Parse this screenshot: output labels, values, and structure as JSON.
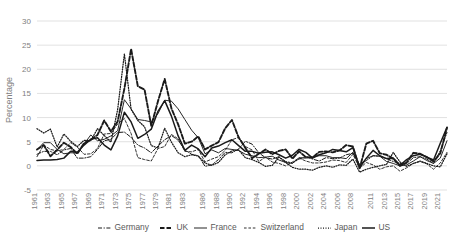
{
  "chart_data": {
    "type": "line",
    "title": "",
    "xlabel": "",
    "ylabel": "Percentage",
    "ylim": [
      -5,
      30
    ],
    "ytick_values": [
      -5,
      0,
      5,
      10,
      15,
      20,
      25,
      30
    ],
    "ytick_labels": [
      "-5",
      "0",
      "5",
      "10",
      "15",
      "20",
      "25",
      "30"
    ],
    "grid": true,
    "legend_position": "bottom",
    "xtick_labels": [
      "1961",
      "1963",
      "1965",
      "1967",
      "1969",
      "1971",
      "1973",
      "1975",
      "1977",
      "1979",
      "1981",
      "1983",
      "1986",
      "1988",
      "1990",
      "1992",
      "1994",
      "1996",
      "1998",
      "2000",
      "2002",
      "2004",
      "2006",
      "2008",
      "2011",
      "2013",
      "2015",
      "2017",
      "2019",
      "2021"
    ],
    "x": [
      1961,
      1962,
      1963,
      1964,
      1965,
      1966,
      1967,
      1968,
      1969,
      1970,
      1971,
      1972,
      1973,
      1974,
      1975,
      1976,
      1977,
      1978,
      1979,
      1980,
      1981,
      1982,
      1983,
      1984,
      1985,
      1986,
      1987,
      1988,
      1989,
      1990,
      1991,
      1992,
      1993,
      1994,
      1995,
      1996,
      1997,
      1998,
      1999,
      2000,
      2001,
      2002,
      2003,
      2004,
      2005,
      2006,
      2007,
      2008,
      2009,
      2010,
      2011,
      2012,
      2013,
      2014,
      2015,
      2016,
      2017,
      2018,
      2019,
      2020,
      2021,
      2022
    ],
    "series": [
      {
        "name": "Germany",
        "style": "dash-dot",
        "color": "#333333",
        "values": [
          2.4,
          3.0,
          3.0,
          2.3,
          3.3,
          3.6,
          1.6,
          1.6,
          1.9,
          3.4,
          5.2,
          5.5,
          6.9,
          7.0,
          5.9,
          4.3,
          3.7,
          2.7,
          4.1,
          5.4,
          6.3,
          5.3,
          3.3,
          2.4,
          2.1,
          -0.1,
          0.2,
          1.3,
          2.8,
          2.7,
          3.5,
          5.1,
          4.5,
          2.7,
          1.7,
          1.4,
          1.9,
          0.9,
          0.6,
          1.4,
          1.9,
          1.4,
          1.0,
          1.7,
          1.5,
          1.6,
          2.3,
          2.6,
          0.3,
          1.1,
          2.1,
          2.0,
          1.5,
          0.9,
          0.5,
          0.5,
          1.7,
          1.9,
          1.4,
          0.5,
          3.1,
          6.9
        ]
      },
      {
        "name": "UK",
        "style": "dash",
        "color": "#111111",
        "values": [
          3.4,
          4.3,
          2.0,
          3.3,
          4.8,
          3.9,
          2.5,
          4.7,
          5.4,
          6.4,
          9.4,
          7.1,
          9.2,
          16.0,
          24.2,
          16.5,
          15.8,
          8.3,
          13.4,
          18.0,
          11.9,
          8.6,
          4.6,
          5.0,
          6.1,
          3.4,
          4.2,
          4.9,
          7.8,
          9.5,
          5.9,
          3.7,
          1.6,
          2.5,
          3.4,
          2.4,
          3.1,
          3.4,
          1.5,
          3.0,
          1.8,
          1.7,
          2.9,
          3.0,
          2.8,
          3.2,
          4.3,
          4.0,
          -0.5,
          4.6,
          5.2,
          2.6,
          2.3,
          1.5,
          0.0,
          0.7,
          2.7,
          2.5,
          1.8,
          0.9,
          2.6,
          7.9
        ]
      },
      {
        "name": "France",
        "style": "solid",
        "color": "#3d3d3d",
        "values": [
          3.3,
          4.8,
          4.8,
          3.4,
          2.5,
          2.7,
          2.7,
          4.5,
          6.4,
          5.2,
          5.5,
          6.2,
          7.3,
          13.7,
          11.8,
          9.6,
          9.4,
          9.1,
          10.8,
          13.6,
          13.4,
          11.8,
          9.6,
          7.4,
          5.8,
          2.5,
          3.3,
          2.7,
          3.6,
          3.4,
          3.2,
          2.4,
          2.1,
          1.7,
          1.8,
          2.0,
          1.2,
          0.7,
          0.5,
          1.7,
          1.6,
          1.9,
          2.1,
          2.1,
          1.7,
          1.7,
          1.5,
          2.8,
          0.1,
          1.5,
          2.1,
          2.0,
          0.9,
          0.5,
          0.0,
          0.2,
          1.0,
          1.9,
          1.1,
          0.5,
          1.6,
          5.2
        ]
      },
      {
        "name": "Switzerland",
        "style": "dash-light",
        "color": "#8c8c8c",
        "values": [
          1.9,
          4.3,
          3.4,
          3.1,
          3.4,
          4.8,
          3.9,
          2.4,
          2.5,
          3.6,
          6.6,
          6.7,
          8.7,
          9.8,
          6.7,
          1.7,
          1.3,
          1.0,
          3.6,
          4.0,
          6.5,
          5.6,
          3.0,
          2.9,
          3.4,
          0.8,
          1.4,
          1.9,
          3.2,
          5.4,
          5.9,
          4.0,
          3.3,
          0.9,
          1.8,
          0.8,
          0.5,
          0.0,
          0.8,
          1.6,
          1.0,
          0.6,
          0.6,
          0.8,
          1.2,
          1.1,
          0.7,
          2.4,
          -0.5,
          0.7,
          0.2,
          -0.7,
          -0.2,
          0.0,
          -1.1,
          -0.4,
          0.5,
          0.9,
          0.4,
          -0.7,
          0.6,
          2.8
        ]
      },
      {
        "name": "Japan",
        "style": "dot",
        "color": "#555555",
        "values": [
          7.7,
          6.8,
          7.6,
          3.9,
          6.6,
          5.1,
          4.0,
          5.3,
          5.2,
          7.7,
          6.3,
          4.9,
          11.7,
          23.2,
          11.7,
          9.4,
          8.1,
          4.2,
          3.7,
          7.8,
          4.9,
          2.7,
          1.9,
          2.3,
          2.0,
          0.6,
          0.1,
          0.7,
          2.3,
          3.1,
          3.3,
          1.7,
          1.3,
          0.7,
          -0.1,
          0.1,
          1.8,
          0.7,
          -0.3,
          -0.7,
          -0.7,
          -0.9,
          -0.3,
          0.0,
          -0.3,
          0.2,
          0.1,
          1.4,
          -1.3,
          -0.7,
          -0.3,
          0.0,
          0.3,
          2.8,
          0.8,
          -0.1,
          0.5,
          1.0,
          0.5,
          0.0,
          -0.2,
          2.5
        ]
      },
      {
        "name": "US",
        "style": "solid-bold",
        "color": "#0d0d0d",
        "values": [
          1.1,
          1.2,
          1.2,
          1.3,
          1.6,
          3.0,
          2.8,
          4.3,
          5.5,
          5.8,
          4.3,
          3.3,
          6.2,
          11.1,
          9.1,
          5.7,
          6.5,
          7.6,
          11.3,
          13.5,
          10.3,
          6.2,
          3.2,
          4.3,
          3.5,
          1.9,
          3.7,
          4.1,
          4.8,
          5.4,
          4.2,
          3.0,
          3.0,
          2.6,
          2.8,
          2.9,
          2.3,
          1.6,
          2.2,
          3.4,
          2.8,
          1.6,
          2.3,
          2.7,
          3.4,
          3.2,
          2.9,
          3.8,
          -0.4,
          1.6,
          3.2,
          2.1,
          1.5,
          1.6,
          0.1,
          1.3,
          2.1,
          2.4,
          1.8,
          1.2,
          4.7,
          8.0
        ]
      }
    ]
  },
  "legend": {
    "entries": [
      {
        "label": "Germany",
        "style": "dash-dot"
      },
      {
        "label": "UK",
        "style": "dash"
      },
      {
        "label": "France",
        "style": "solid"
      },
      {
        "label": "Switzerland",
        "style": "dash-light"
      },
      {
        "label": "Japan",
        "style": "dot"
      },
      {
        "label": "US",
        "style": "solid-bold"
      }
    ]
  }
}
